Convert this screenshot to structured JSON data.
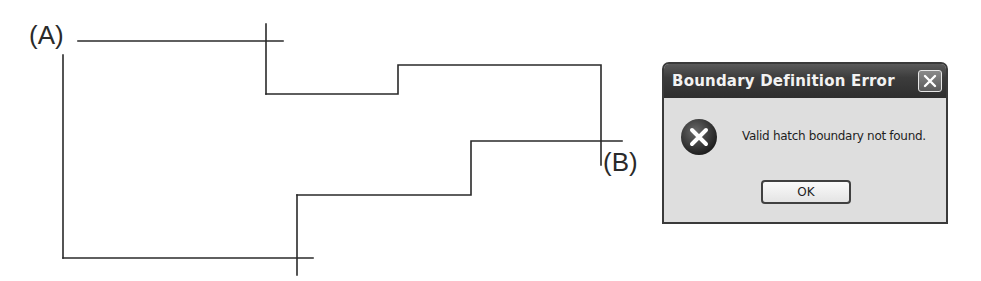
{
  "diagram": {
    "labels": {
      "a": "(A)",
      "b": "(B)"
    },
    "line_color": "#2a2a2a"
  },
  "dialog": {
    "title": "Boundary Definition Error",
    "close_icon": "close-icon",
    "icon": "error-icon",
    "message": "Valid hatch boundary not found.",
    "ok_label": "OK"
  }
}
